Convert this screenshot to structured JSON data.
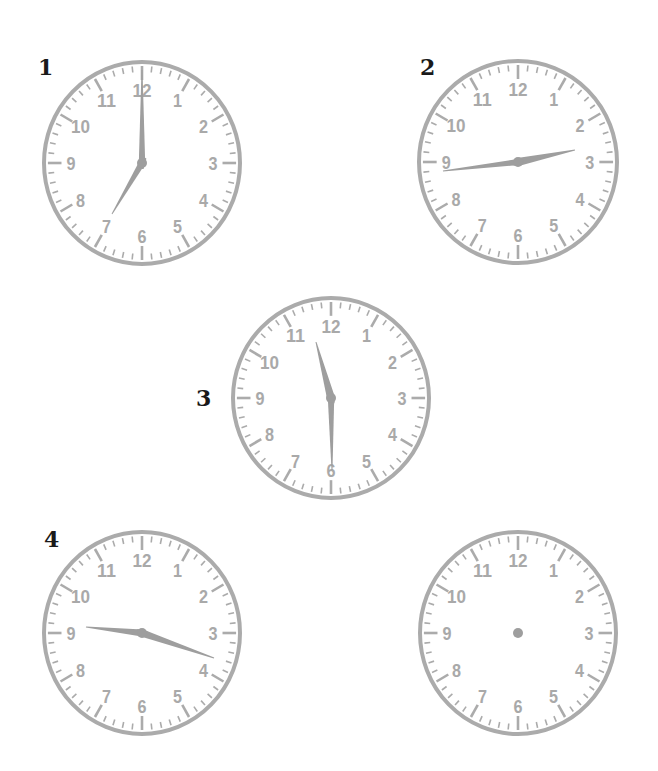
{
  "worksheet": {
    "colors": {
      "face_stroke": "#ababab",
      "tick": "#ababab",
      "numeral": "#a9a9a9",
      "hand": "#9e9e9e",
      "label": "#1a1a1a"
    },
    "numerals": [
      "12",
      "1",
      "2",
      "3",
      "4",
      "5",
      "6",
      "7",
      "8",
      "9",
      "10",
      "11"
    ],
    "clocks": [
      {
        "id": "clock-1",
        "label": "1",
        "label_pos": [
          38,
          56
        ],
        "center": [
          142,
          163
        ],
        "radius": [
          100,
          103
        ],
        "time": "7:00",
        "hands": {
          "hour": {
            "tip": [
              -30,
              51
            ],
            "width": 3.2
          },
          "minute": {
            "tip": [
              0,
              -93
            ],
            "width": 3.2
          }
        }
      },
      {
        "id": "clock-2",
        "label": "2",
        "label_pos": [
          420,
          56
        ],
        "center": [
          518,
          162
        ],
        "radius": [
          101,
          103
        ],
        "time": "2:45",
        "hands": {
          "hour": {
            "tip": [
              57,
              -12
            ],
            "width": 4
          },
          "minute": {
            "tip": [
              -75,
              9
            ],
            "width": 3
          }
        }
      },
      {
        "id": "clock-3",
        "label": "3",
        "label_pos": [
          196,
          387
        ],
        "center": [
          331,
          398
        ],
        "radius": [
          100,
          102
        ],
        "time": "11:30",
        "hands": {
          "hour": {
            "tip": [
              -15,
              -56
            ],
            "width": 4
          },
          "minute": {
            "tip": [
              1,
              72
            ],
            "width": 3.2
          }
        }
      },
      {
        "id": "clock-4",
        "label": "4",
        "label_pos": [
          44,
          528
        ],
        "center": [
          142,
          633
        ],
        "radius": [
          100,
          103
        ],
        "time": "9:20",
        "hands": {
          "hour": {
            "tip": [
              -56,
              -6
            ],
            "width": 3.6
          },
          "minute": {
            "tip": [
              72,
              25
            ],
            "width": 3.6
          }
        }
      },
      {
        "id": "clock-5",
        "label": "",
        "label_pos": [
          0,
          0
        ],
        "center": [
          518,
          633
        ],
        "radius": [
          100,
          103
        ],
        "time": "",
        "hands": null
      }
    ]
  }
}
